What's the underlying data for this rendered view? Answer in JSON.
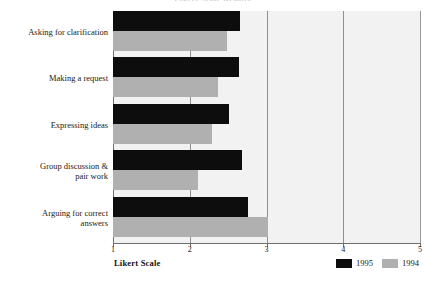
{
  "chart_data": {
    "type": "bar",
    "orientation": "horizontal",
    "title": "Likert Scale Results",
    "xlabel": "Likert Scale",
    "ylabel": "",
    "xlim": [
      1,
      5
    ],
    "xticks": [
      "1",
      "2",
      "3",
      "4",
      "5"
    ],
    "grid": true,
    "legend_position": "bottom-right",
    "categories": [
      "Asking for clarification",
      "Making a request",
      "Expressing ideas",
      "Group discussion & pair work",
      "Arguing for correct answers"
    ],
    "series": [
      {
        "name": "1995",
        "color": "#0d0d0d",
        "values": [
          2.65,
          2.64,
          2.51,
          2.68,
          2.76
        ]
      },
      {
        "name": "1994",
        "color": "#b0b0b0",
        "values": [
          2.49,
          2.37,
          2.29,
          2.11,
          3.02
        ]
      }
    ]
  },
  "legend": {
    "items": [
      {
        "label": "1995",
        "color": "#0d0d0d"
      },
      {
        "label": "1994",
        "color": "#b0b0b0"
      }
    ]
  },
  "colors": {
    "series_1995": "#0d0d0d",
    "series_1994": "#b0b0b0",
    "plot_background": "#f2f2f2",
    "axis": "#6f6f6f",
    "gridline": "#8f8f8f"
  }
}
